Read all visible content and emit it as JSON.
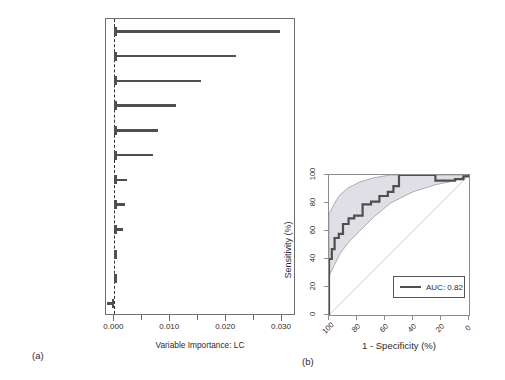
{
  "figure": {
    "panel_a_letter": "(a)",
    "panel_b_letter": "(b)"
  },
  "chart_data": [
    {
      "type": "bar",
      "orientation": "horizontal",
      "title": "",
      "xlabel": "Variable Importance: LC",
      "ylabel": "",
      "xlim": [
        -0.0015,
        0.0325
      ],
      "xticks": [
        0.0,
        0.005,
        0.01,
        0.015,
        0.02,
        0.025,
        0.03
      ],
      "xticklabels": [
        "0.000",
        "",
        "0.010",
        "",
        "0.020",
        "",
        "0.030"
      ],
      "grid": false,
      "reference_line": 0.0,
      "reference_line_style": "dashed",
      "categories": [
        "miR_18a_5p",
        "Stage",
        "miR_20a_5p",
        "miR_17_5p",
        "miR_19b_3p",
        "cxcr1_Rs2234671",
        "SLP_fractalkine",
        "miR_224_5p",
        "Tumor_gEUD",
        "pre_MCP_1",
        "RD_GLSZM_ZSV",
        "GLRLM_RLN"
      ],
      "values": [
        0.0297,
        0.0218,
        0.0155,
        0.0111,
        0.0078,
        0.0069,
        0.0022,
        0.0019,
        0.0016,
        0.0003,
        0.0002,
        -0.0013
      ]
    },
    {
      "type": "line",
      "subtype": "roc",
      "title": "",
      "xlabel": "1 - Specificity (%)",
      "ylabel": "Sensitivity (%)",
      "xlim": [
        100,
        0
      ],
      "ylim": [
        0,
        100
      ],
      "xticks": [
        100,
        80,
        60,
        40,
        20,
        0
      ],
      "xticklabels": [
        "100",
        "80",
        "60",
        "40",
        "20",
        "0"
      ],
      "yticks": [
        0,
        20,
        40,
        60,
        80,
        100
      ],
      "yticklabels": [
        "0",
        "20",
        "40",
        "60",
        "80",
        "100"
      ],
      "grid": false,
      "legend_position": "bottom-right",
      "legend": [
        "AUC: 0.82"
      ],
      "auc_label": "AUC: 0.82",
      "diagonal_reference": true,
      "confidence_band": true,
      "roc_points": [
        [
          100,
          0
        ],
        [
          100,
          29
        ],
        [
          100,
          40
        ],
        [
          98,
          40
        ],
        [
          98,
          47
        ],
        [
          96,
          47
        ],
        [
          96,
          55
        ],
        [
          93,
          55
        ],
        [
          93,
          58
        ],
        [
          90,
          58
        ],
        [
          90,
          65
        ],
        [
          86,
          65
        ],
        [
          86,
          69
        ],
        [
          82,
          69
        ],
        [
          82,
          71
        ],
        [
          76,
          71
        ],
        [
          76,
          79
        ],
        [
          70,
          79
        ],
        [
          70,
          81
        ],
        [
          64,
          81
        ],
        [
          64,
          85
        ],
        [
          58,
          85
        ],
        [
          58,
          88
        ],
        [
          54,
          88
        ],
        [
          54,
          92
        ],
        [
          50,
          92
        ],
        [
          50,
          100
        ],
        [
          24,
          100
        ],
        [
          24,
          96
        ],
        [
          10,
          96
        ],
        [
          10,
          97
        ],
        [
          4,
          97
        ],
        [
          4,
          99
        ],
        [
          0,
          99
        ],
        [
          0,
          100
        ]
      ],
      "ci_upper": [
        [
          100,
          0
        ],
        [
          100,
          72
        ],
        [
          96,
          80
        ],
        [
          92,
          86
        ],
        [
          86,
          91
        ],
        [
          78,
          95
        ],
        [
          68,
          98
        ],
        [
          56,
          100
        ],
        [
          40,
          100
        ],
        [
          20,
          100
        ],
        [
          0,
          100
        ]
      ],
      "ci_lower": [
        [
          100,
          0
        ],
        [
          100,
          28
        ],
        [
          96,
          36
        ],
        [
          92,
          44
        ],
        [
          86,
          52
        ],
        [
          78,
          60
        ],
        [
          68,
          70
        ],
        [
          56,
          80
        ],
        [
          40,
          88
        ],
        [
          24,
          93
        ],
        [
          10,
          96
        ],
        [
          0,
          100
        ]
      ]
    }
  ],
  "colors": {
    "bar": "#4f4f4f",
    "roc_curve": "#4f4f4f",
    "ci_band": "#d9d9e0",
    "ci_edge": "#9a9aa6",
    "diagonal": "#cfcfcf",
    "axis": "#6e6e6e",
    "text": "#2b2b2b"
  }
}
